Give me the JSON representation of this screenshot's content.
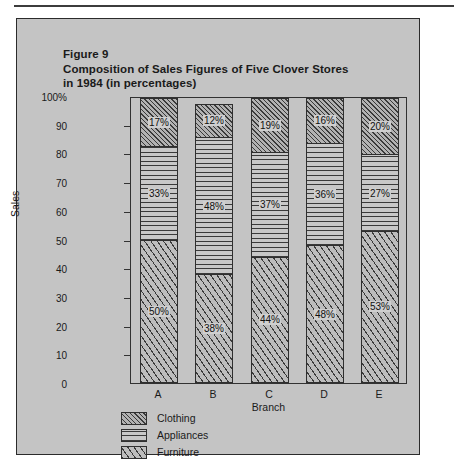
{
  "figure": {
    "label": "Figure 9",
    "title_line1": "Composition of Sales Figures of Five Clover Stores",
    "title_line2": "in 1984 (in percentages)"
  },
  "chart_data": {
    "type": "bar",
    "subtype": "stacked-100-percent",
    "title": "Composition of Sales Figures of Five Clover Stores in 1984 (in percentages)",
    "xlabel": "Branch",
    "ylabel": "Sales",
    "categories": [
      "A",
      "B",
      "C",
      "D",
      "E"
    ],
    "ylim": [
      0,
      100
    ],
    "yticks": [
      0,
      10,
      20,
      30,
      40,
      50,
      60,
      70,
      80,
      90,
      100
    ],
    "ytick_labels": [
      "0",
      "10",
      "20",
      "30",
      "40",
      "50",
      "60",
      "70",
      "80",
      "90",
      "100%"
    ],
    "grid": false,
    "legend_position": "below-left",
    "series": [
      {
        "name": "Clothing",
        "pattern": "diagonal-dense",
        "values": [
          17,
          12,
          19,
          16,
          20
        ],
        "labels": [
          "17%",
          "12%",
          "19%",
          "16%",
          "20%"
        ]
      },
      {
        "name": "Appliances",
        "pattern": "horizontal-lines",
        "values": [
          33,
          48,
          37,
          36,
          27
        ],
        "labels": [
          "33%",
          "48%",
          "37%",
          "36%",
          "27%"
        ]
      },
      {
        "name": "Furniture",
        "pattern": "diagonal-sparse",
        "values": [
          50,
          38,
          44,
          48,
          53
        ],
        "labels": [
          "50%",
          "38%",
          "44%",
          "48%",
          "53%"
        ]
      }
    ]
  },
  "colors": {
    "page_background": "#ffffff",
    "panel_background": "#c4c4c4",
    "ink": "#1a1a1a",
    "axis": "#323232",
    "hatch": "#3a3a3a"
  }
}
